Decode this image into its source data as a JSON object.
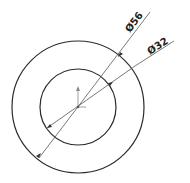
{
  "drawing": {
    "outer_circle": {
      "label": "Ø56",
      "diameter": 56
    },
    "inner_circle": {
      "label": "Ø32",
      "diameter": 32
    },
    "colors": {
      "stroke": "#2a2a2a",
      "leader": "#555555",
      "origin": "#888888",
      "background": "#ffffff"
    }
  }
}
